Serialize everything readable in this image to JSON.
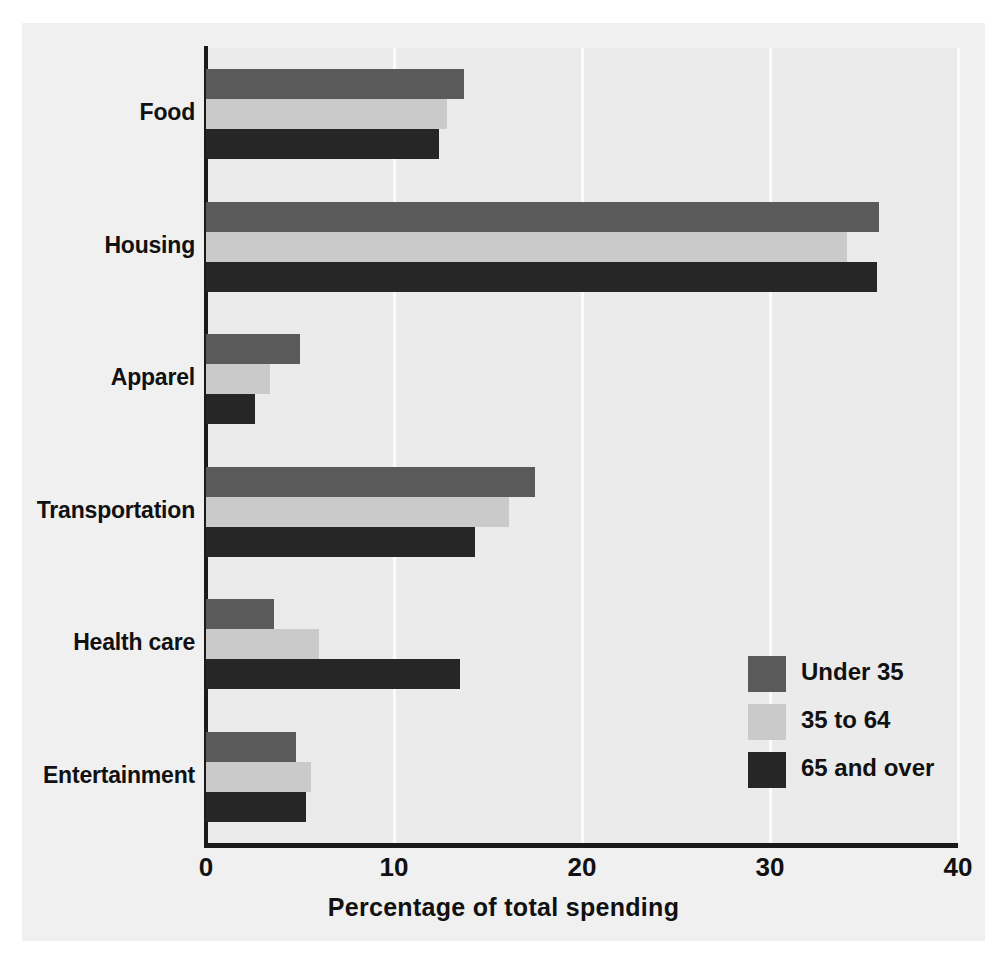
{
  "chart_data": {
    "type": "bar",
    "orientation": "horizontal",
    "title": "",
    "xlabel": "Percentage of total spending",
    "ylabel": "",
    "xlim": [
      0,
      40
    ],
    "xticks": [
      "0",
      "10",
      "20",
      "30",
      "40"
    ],
    "xtick_values": [
      0,
      10,
      20,
      30,
      40
    ],
    "grid": "vertical",
    "legend_position": "inside-right-lower",
    "categories": [
      "Food",
      "Housing",
      "Apparel",
      "Transportation",
      "Health care",
      "Entertainment"
    ],
    "series": [
      {
        "name": "Under 35",
        "color": "#5a5a5a",
        "values": [
          13.7,
          35.8,
          5.0,
          17.5,
          3.6,
          4.8
        ]
      },
      {
        "name": "35 to 64",
        "color": "#cacaca",
        "values": [
          12.8,
          34.1,
          3.4,
          16.1,
          6.0,
          5.6
        ]
      },
      {
        "name": "65 and over",
        "color": "#262626",
        "values": [
          12.4,
          35.7,
          2.6,
          14.3,
          13.5,
          5.3
        ]
      }
    ]
  },
  "colors": {
    "page_background": "#ffffff",
    "panel_background": "#f0f0f0",
    "plot_background": "#ebebeb",
    "axis": "#1a1a1a",
    "gridline": "#fbfbfb",
    "text": "#111111"
  }
}
